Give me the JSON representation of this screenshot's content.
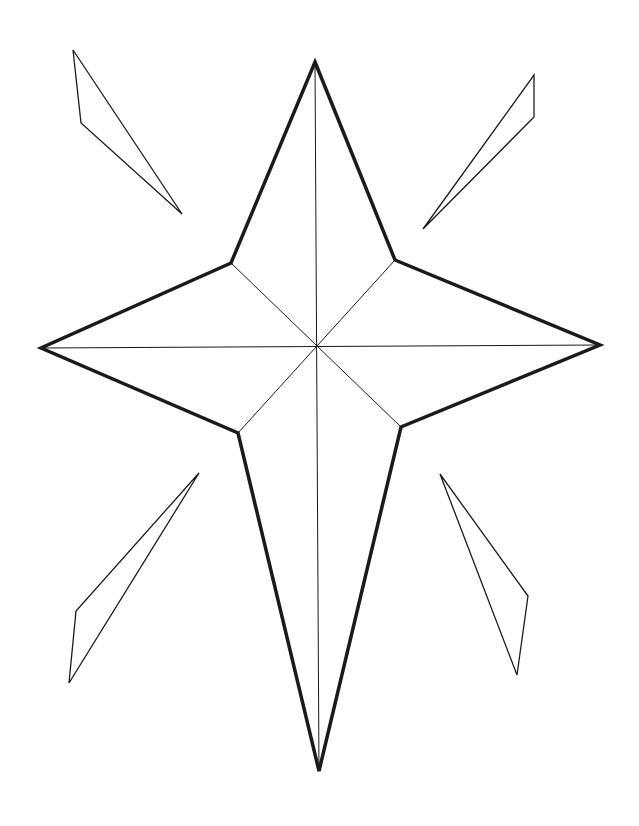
{
  "colors": {
    "background": "#ffffff",
    "stroke": "#1a1a1a"
  },
  "star": {
    "center": [
      316,
      348
    ],
    "outer_points": {
      "top": [
        315,
        62
      ],
      "right": [
        600,
        345
      ],
      "bottom": [
        319,
        771
      ],
      "left": [
        41,
        348
      ]
    },
    "inner_points": {
      "upper_right": [
        395,
        260
      ],
      "lower_right": [
        401,
        427
      ],
      "lower_left": [
        238,
        433
      ],
      "upper_left": [
        231,
        263
      ]
    },
    "outline_width": 3.5,
    "fold_line_width": 1
  },
  "shards": [
    {
      "name": "top-left",
      "points": [
        [
          73,
          50
        ],
        [
          81,
          123
        ],
        [
          182,
          214
        ]
      ]
    },
    {
      "name": "top-right",
      "points": [
        [
          534,
          75
        ],
        [
          534,
          117
        ],
        [
          423,
          229
        ]
      ]
    },
    {
      "name": "bottom-left",
      "points": [
        [
          199,
          473
        ],
        [
          76,
          611
        ],
        [
          69,
          683
        ]
      ]
    },
    {
      "name": "bottom-right",
      "points": [
        [
          440,
          474
        ],
        [
          528,
          596
        ],
        [
          517,
          675
        ]
      ]
    }
  ]
}
